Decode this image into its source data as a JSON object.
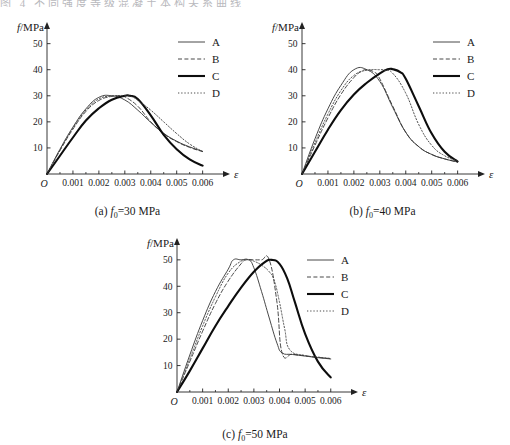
{
  "page": {
    "cropped_header_text": "图 4  不同强度等级混凝土本构关系曲线"
  },
  "panels": [
    {
      "id": "panel-a",
      "caption_prefix": "(a)",
      "caption_symbol": "f",
      "caption_sub": "0",
      "caption_value": "=30 MPa"
    },
    {
      "id": "panel-b",
      "caption_prefix": "(b)",
      "caption_symbol": "f",
      "caption_sub": "0",
      "caption_value": "=40 MPa"
    },
    {
      "id": "panel-c",
      "caption_prefix": "(c)",
      "caption_symbol": "f",
      "caption_sub": "0",
      "caption_value": "=50 MPa"
    }
  ],
  "axes": {
    "y_title": "f/MPa",
    "x_title": "ε",
    "origin_label": "O",
    "y_ticks": [
      10,
      20,
      30,
      40,
      50
    ],
    "x_ticks": [
      0.001,
      0.002,
      0.003,
      0.004,
      0.005,
      0.006
    ],
    "x_tick_labels": [
      "0.001",
      "0.002",
      "0.003",
      "0.004",
      "0.005",
      "0.006"
    ],
    "y_tick_labels": [
      "10",
      "20",
      "30",
      "40",
      "50"
    ],
    "xlim": [
      0,
      0.0064
    ],
    "ylim": [
      0,
      56
    ]
  },
  "legend": {
    "entries": [
      {
        "label": "A",
        "style": "thin-solid",
        "color": "#2b2b2b"
      },
      {
        "label": "B",
        "style": "dashed",
        "color": "#2b2b2b"
      },
      {
        "label": "C",
        "style": "thick-solid",
        "color": "#111111"
      },
      {
        "label": "D",
        "style": "dotted",
        "color": "#3a3a3a"
      }
    ]
  },
  "chart_data": [
    {
      "type": "line",
      "title": "(a) f0=30 MPa",
      "xlabel": "ε",
      "ylabel": "f/MPa",
      "xlim": [
        0,
        0.0064
      ],
      "ylim": [
        0,
        56
      ],
      "grid": false,
      "legend_position": "top-right",
      "series": [
        {
          "name": "A",
          "style": "thin-solid",
          "x": [
            0,
            0.0005,
            0.001,
            0.0015,
            0.002,
            0.0025,
            0.003,
            0.0035,
            0.004,
            0.0045,
            0.005,
            0.0055,
            0.006
          ],
          "y": [
            0,
            9.5,
            18.0,
            25.0,
            29.4,
            30.0,
            28.4,
            24.5,
            19.8,
            15.6,
            12.6,
            10.4,
            8.7
          ]
        },
        {
          "name": "B",
          "style": "dashed",
          "x": [
            0,
            0.0005,
            0.001,
            0.0015,
            0.002,
            0.0025,
            0.0028,
            0.003,
            0.0035,
            0.004,
            0.0045,
            0.005,
            0.0055,
            0.006
          ],
          "y": [
            0,
            9.0,
            17.2,
            24.0,
            28.2,
            29.8,
            30.0,
            29.6,
            26.0,
            20.0,
            15.5,
            12.4,
            10.2,
            8.6
          ]
        },
        {
          "name": "C",
          "style": "thick-solid",
          "x": [
            0,
            0.0005,
            0.001,
            0.0015,
            0.002,
            0.0025,
            0.003,
            0.0032,
            0.0035,
            0.004,
            0.0045,
            0.005,
            0.0055,
            0.006
          ],
          "y": [
            0,
            7.0,
            14.0,
            20.5,
            25.2,
            28.5,
            30.0,
            30.0,
            28.8,
            22.5,
            15.0,
            9.5,
            5.6,
            3.2
          ]
        },
        {
          "name": "D",
          "style": "dotted",
          "x": [
            0,
            0.0005,
            0.001,
            0.0015,
            0.002,
            0.0025,
            0.003,
            0.0033,
            0.0036,
            0.004,
            0.0045,
            0.005,
            0.0055,
            0.006
          ],
          "y": [
            0,
            9.2,
            17.6,
            24.5,
            28.8,
            29.9,
            30.0,
            29.5,
            27.5,
            24.5,
            20.0,
            15.5,
            11.5,
            8.6
          ]
        }
      ]
    },
    {
      "type": "line",
      "title": "(b) f0=40 MPa",
      "xlabel": "ε",
      "ylabel": "f/MPa",
      "xlim": [
        0,
        0.0064
      ],
      "ylim": [
        0,
        56
      ],
      "grid": false,
      "legend_position": "top-right",
      "series": [
        {
          "name": "A",
          "style": "thin-solid",
          "x": [
            0,
            0.0005,
            0.001,
            0.0015,
            0.002,
            0.0025,
            0.003,
            0.0035,
            0.004,
            0.0045,
            0.005,
            0.0055,
            0.006
          ],
          "y": [
            0,
            13.5,
            25.0,
            34.0,
            40.0,
            40.0,
            35.5,
            25.5,
            16.0,
            10.5,
            7.5,
            5.8,
            4.6
          ]
        },
        {
          "name": "B",
          "style": "dashed",
          "x": [
            0,
            0.0005,
            0.001,
            0.0015,
            0.002,
            0.0023,
            0.0025,
            0.0028,
            0.003,
            0.0035,
            0.004,
            0.0045,
            0.005,
            0.0055,
            0.006
          ],
          "y": [
            0,
            11.0,
            21.5,
            30.5,
            37.0,
            39.4,
            40.0,
            39.0,
            36.5,
            26.0,
            16.0,
            10.5,
            7.5,
            5.8,
            4.6
          ]
        },
        {
          "name": "C",
          "style": "thick-solid",
          "x": [
            0,
            0.0005,
            0.001,
            0.0015,
            0.002,
            0.0025,
            0.003,
            0.0033,
            0.0035,
            0.0038,
            0.004,
            0.0045,
            0.005,
            0.0055,
            0.006
          ],
          "y": [
            0,
            8.5,
            17.0,
            24.5,
            30.5,
            35.0,
            38.6,
            40.2,
            40.2,
            39.0,
            36.5,
            26.0,
            15.5,
            8.5,
            4.8
          ]
        },
        {
          "name": "D",
          "style": "dotted",
          "x": [
            0,
            0.0005,
            0.001,
            0.0015,
            0.002,
            0.0025,
            0.003,
            0.0032,
            0.0035,
            0.004,
            0.0045,
            0.005,
            0.0055,
            0.006
          ],
          "y": [
            0,
            12.0,
            23.0,
            32.0,
            37.8,
            39.8,
            40.0,
            39.8,
            38.6,
            31.0,
            19.0,
            11.0,
            7.0,
            5.0
          ]
        }
      ]
    },
    {
      "type": "line",
      "title": "(c) f0=50 MPa",
      "xlabel": "ε",
      "ylabel": "f/MPa",
      "xlim": [
        0,
        0.0064
      ],
      "ylim": [
        0,
        56
      ],
      "grid": false,
      "legend_position": "top-right",
      "series": [
        {
          "name": "A",
          "style": "thin-solid",
          "x": [
            0,
            0.0005,
            0.001,
            0.0015,
            0.002,
            0.0022,
            0.0025,
            0.0028,
            0.003,
            0.0033,
            0.0036,
            0.0039,
            0.0041,
            0.0045,
            0.005,
            0.0055,
            0.006
          ],
          "y": [
            0,
            14.0,
            27.0,
            38.0,
            46.5,
            50.0,
            50.0,
            50.0,
            47.0,
            38.0,
            28.0,
            18.5,
            14.8,
            14.2,
            13.6,
            13.0,
            12.5
          ]
        },
        {
          "name": "B",
          "style": "dashed",
          "x": [
            0,
            0.0005,
            0.001,
            0.0015,
            0.002,
            0.0025,
            0.0027,
            0.003,
            0.0033,
            0.0036,
            0.0039,
            0.0041,
            0.0045,
            0.005,
            0.0055,
            0.006
          ],
          "y": [
            0,
            11.5,
            23.0,
            33.5,
            42.0,
            48.5,
            50.0,
            50.0,
            50.0,
            50.0,
            34.0,
            14.8,
            14.3,
            13.7,
            13.1,
            12.6
          ]
        },
        {
          "name": "C",
          "style": "thick-solid",
          "x": [
            0,
            0.0005,
            0.001,
            0.0015,
            0.002,
            0.0025,
            0.003,
            0.0034,
            0.0037,
            0.004,
            0.0043,
            0.0046,
            0.005,
            0.0055,
            0.006
          ],
          "y": [
            0,
            8.0,
            16.5,
            25.0,
            32.5,
            39.5,
            45.5,
            49.0,
            50.0,
            48.5,
            43.0,
            34.0,
            22.0,
            11.5,
            5.5
          ]
        },
        {
          "name": "D",
          "style": "dotted",
          "x": [
            0,
            0.0005,
            0.001,
            0.0015,
            0.002,
            0.0025,
            0.0028,
            0.003,
            0.0033,
            0.0036,
            0.0038,
            0.004,
            0.0042,
            0.0044,
            0.005,
            0.0055,
            0.006
          ],
          "y": [
            0,
            12.5,
            25.0,
            36.0,
            45.0,
            49.5,
            50.0,
            49.5,
            48.0,
            45.5,
            42.0,
            34.0,
            24.0,
            16.0,
            13.8,
            13.2,
            12.7
          ]
        }
      ]
    }
  ]
}
